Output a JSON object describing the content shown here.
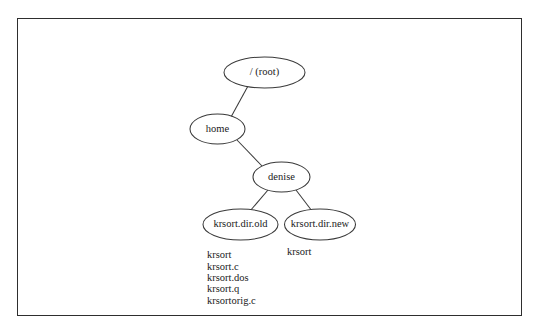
{
  "diagram": {
    "type": "tree",
    "title_visible": false,
    "background_color": "#ffffff",
    "border_color": "#2e2e2e",
    "line_color": "#3a3a3a",
    "text_color": "#1a1a1a",
    "nodes": [
      {
        "id": "root",
        "label": "/ (root)",
        "cx": 264.5,
        "cy": 72.5,
        "rx": 40.5,
        "ry": 15.5
      },
      {
        "id": "home",
        "label": "home",
        "cx": 217.5,
        "cy": 129.0,
        "rx": 27.5,
        "ry": 15.0
      },
      {
        "id": "denise",
        "label": "denise",
        "cx": 281.5,
        "cy": 177.0,
        "rx": 28.5,
        "ry": 15.0
      },
      {
        "id": "dirold",
        "label": "krsort.dir.old",
        "cx": 240.5,
        "cy": 224.5,
        "rx": 37.5,
        "ry": 15.5
      },
      {
        "id": "dirnew",
        "label": "krsort.dir.new",
        "cx": 320.0,
        "cy": 224.5,
        "rx": 35.5,
        "ry": 15.5
      }
    ],
    "edges": [
      {
        "from": "root",
        "to": "home",
        "x1": 248.0,
        "y1": 86.0,
        "x2": 231.0,
        "y2": 117.0
      },
      {
        "from": "home",
        "to": "denise",
        "x1": 237.0,
        "y1": 140.0,
        "x2": 262.0,
        "y2": 166.0
      },
      {
        "from": "denise",
        "to": "dirold",
        "x1": 268.0,
        "y1": 190.0,
        "x2": 250.0,
        "y2": 211.0
      },
      {
        "from": "denise",
        "to": "dirnew",
        "x1": 296.0,
        "y1": 190.0,
        "x2": 312.0,
        "y2": 211.0
      }
    ],
    "file_lists": [
      {
        "id": "dirold-files",
        "x": 207,
        "y": 256,
        "line_height": 11.3,
        "items": [
          "krsort",
          "krsort.c",
          "krsort.dos",
          "krsort.q",
          "krsortorig.c"
        ]
      },
      {
        "id": "dirnew-files",
        "x": 287,
        "y": 253,
        "line_height": 11.3,
        "items": [
          "krsort"
        ]
      }
    ]
  }
}
